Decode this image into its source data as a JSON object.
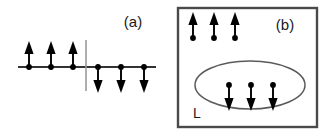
{
  "figure": {
    "width": 328,
    "height": 136,
    "background_color": "#ffffff",
    "ink_color": "#000000"
  },
  "panel_a": {
    "label": "(a)",
    "label_x": 133,
    "label_y": 27,
    "description": "one-dimensional spin chain with a domain wall",
    "axis": {
      "x1": 18,
      "x2": 156,
      "y": 67,
      "color": "#333333"
    },
    "domain_wall": {
      "x": 86,
      "y1": 40,
      "y2": 91,
      "color": "#9a9a9a"
    },
    "spins": [
      {
        "x": 29,
        "direction": "up"
      },
      {
        "x": 51,
        "direction": "up"
      },
      {
        "x": 73,
        "direction": "up"
      },
      {
        "x": 98,
        "direction": "down"
      },
      {
        "x": 121,
        "direction": "down"
      },
      {
        "x": 144,
        "direction": "down"
      }
    ],
    "spin_up_count": 3,
    "spin_down_count": 3
  },
  "panel_b": {
    "label": "(b)",
    "label_x": 285,
    "label_y": 30,
    "description": "two-dimensional spin region containing a reversed domain",
    "box": {
      "x": 178,
      "y": 8,
      "width": 139,
      "height": 119,
      "color": "#4a4a4a"
    },
    "region_label": "L",
    "region_label_x": 197,
    "region_label_y": 118,
    "ellipse": {
      "cx": 250,
      "cy": 85,
      "rx": 55,
      "ry": 24,
      "color": "#5a5a5a"
    },
    "spins": [
      {
        "x": 193,
        "y": 38,
        "direction": "up",
        "inside_domain": false
      },
      {
        "x": 214,
        "y": 38,
        "direction": "up",
        "inside_domain": false
      },
      {
        "x": 235,
        "y": 38,
        "direction": "up",
        "inside_domain": false
      },
      {
        "x": 229,
        "y": 85,
        "direction": "down",
        "inside_domain": true
      },
      {
        "x": 251,
        "y": 85,
        "direction": "down",
        "inside_domain": true
      },
      {
        "x": 273,
        "y": 85,
        "direction": "down",
        "inside_domain": true
      }
    ],
    "spin_up_count": 3,
    "spin_down_count": 3
  }
}
